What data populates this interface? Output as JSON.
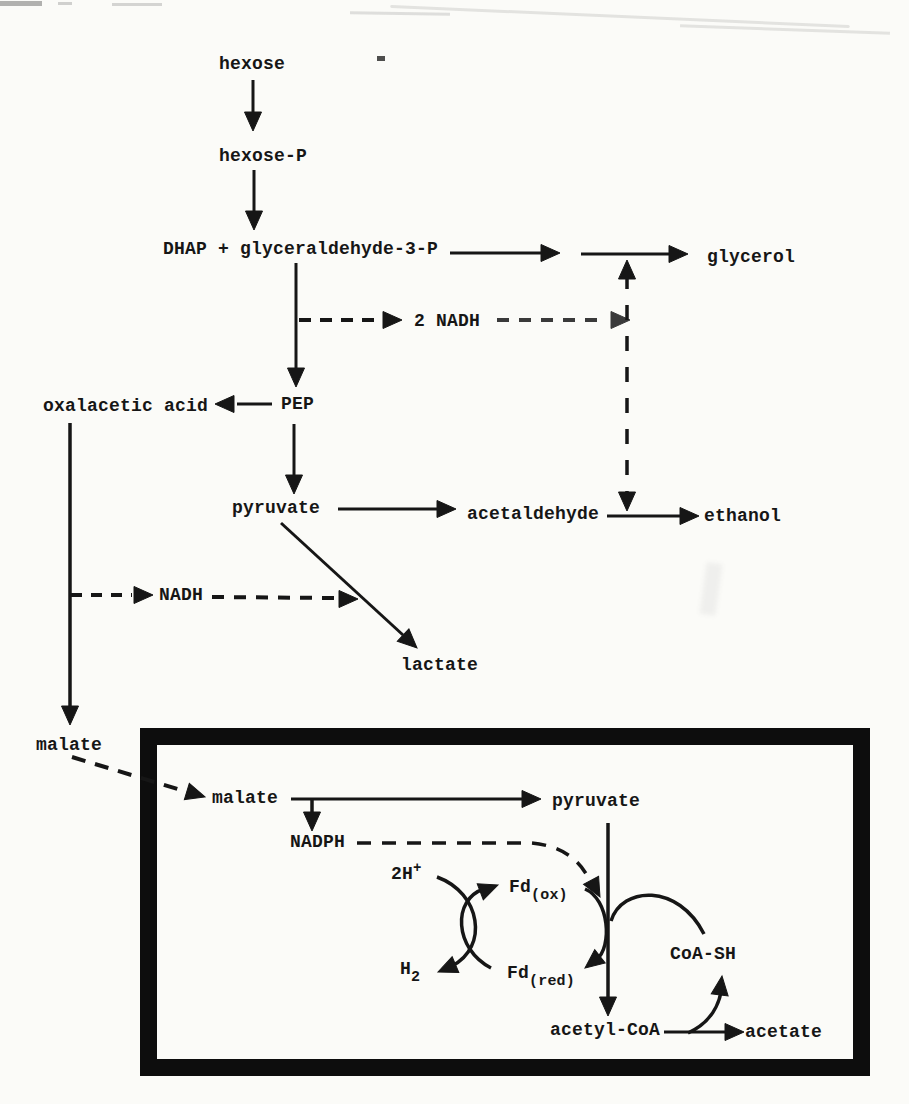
{
  "diagram": {
    "nodes": {
      "hexose": "hexose",
      "hexose_p": "hexose-P",
      "dhap_g3p": "DHAP + glyceraldehyde-3-P",
      "glycerol": "glycerol",
      "two_nadh": "2 NADH",
      "oxalacetic_acid": "oxalacetic acid",
      "pep": "PEP",
      "pyruvate": "pyruvate",
      "acetaldehyde": "acetaldehyde",
      "ethanol": "ethanol",
      "nadh": "NADH",
      "lactate": "lactate",
      "malate_outer": "malate",
      "malate_inner": "malate",
      "pyruvate_inner": "pyruvate",
      "nadph": "NADPH",
      "two_h": {
        "base": "2H",
        "sup": "+"
      },
      "h2": {
        "base": "H",
        "sub": "2"
      },
      "fd_ox": {
        "base": "Fd",
        "sub": "(ox)"
      },
      "fd_red": {
        "base": "Fd",
        "sub": "(red)"
      },
      "coa_sh": "CoA-SH",
      "acetyl_coa": "acetyl-CoA",
      "acetate": "acetate"
    },
    "edges": [
      {
        "from": "hexose",
        "to": "hexose-P",
        "style": "solid"
      },
      {
        "from": "hexose-P",
        "to": "DHAP + glyceraldehyde-3-P",
        "style": "solid"
      },
      {
        "from": "DHAP + glyceraldehyde-3-P",
        "to": "glycerol",
        "style": "solid"
      },
      {
        "from": "DHAP + glyceraldehyde-3-P",
        "to": "2 NADH",
        "style": "dashed"
      },
      {
        "from": "2 NADH",
        "to": "glycerol branch",
        "style": "dashed"
      },
      {
        "from": "DHAP + glyceraldehyde-3-P",
        "to": "PEP",
        "style": "solid"
      },
      {
        "from": "PEP",
        "to": "oxalacetic acid",
        "style": "solid"
      },
      {
        "from": "PEP",
        "to": "pyruvate",
        "style": "solid"
      },
      {
        "from": "pyruvate",
        "to": "acetaldehyde",
        "style": "solid"
      },
      {
        "from": "acetaldehyde",
        "to": "ethanol",
        "style": "solid"
      },
      {
        "from": "glycerol branch",
        "to": "ethanol branch",
        "style": "dashed"
      },
      {
        "from": "pyruvate",
        "to": "lactate",
        "style": "solid"
      },
      {
        "from": "oxalacetic acid",
        "to": "NADH",
        "style": "dashed"
      },
      {
        "from": "NADH",
        "to": "lactate branch",
        "style": "dashed"
      },
      {
        "from": "oxalacetic acid",
        "to": "malate",
        "style": "solid"
      },
      {
        "from": "malate",
        "to": "malate (boxed)",
        "style": "dashed"
      },
      {
        "from": "malate (boxed)",
        "to": "pyruvate (boxed)",
        "style": "solid"
      },
      {
        "from": "malate (boxed)",
        "to": "NADPH",
        "style": "dashed"
      },
      {
        "from": "NADPH",
        "to": "ferredoxin couple",
        "style": "dashed"
      },
      {
        "from": "2H+",
        "to": "H2",
        "style": "solid-curve"
      },
      {
        "from": "Fd(red)",
        "to": "Fd(ox)",
        "style": "solid-curve"
      },
      {
        "from": "Fd(ox)",
        "to": "Fd(red)",
        "style": "solid-curve"
      },
      {
        "from": "pyruvate (boxed)",
        "to": "acetyl-CoA",
        "style": "solid"
      },
      {
        "from": "CoA-SH",
        "to": "pyruvate (boxed)",
        "style": "solid-curve"
      },
      {
        "from": "acetyl-CoA",
        "to": "acetate",
        "style": "solid"
      },
      {
        "from": "acetyl-CoA",
        "to": "CoA-SH",
        "style": "solid-curve"
      }
    ],
    "colors": {
      "ink": "#161616",
      "ink_soft": "#3a3a3a",
      "paper": "#fbfbf8"
    }
  }
}
